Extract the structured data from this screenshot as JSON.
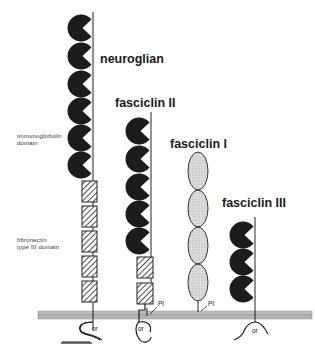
{
  "labels": {
    "neuroglian": "neuroglian",
    "fasciclin_ii": "fasciclin II",
    "fasciclin_i": "fasciclin I",
    "fasciclin_iii": "fasciclin III",
    "ig_domain_line1": "immunoglobulin",
    "ig_domain_line2": "domain",
    "fn_domain_line1": "fibronectin",
    "fn_domain_line2": "type III domain",
    "pi_1": "PI",
    "pi_2": "PI",
    "cyto_1": "or",
    "cyto_2": "or",
    "cyto_3": "or"
  },
  "colors": {
    "ig_domain": "#1c1c1c",
    "membrane": "#b5b5b5",
    "ellipse_fill": "#d6d6d6",
    "line": "#222222"
  },
  "proteins": [
    {
      "name": "neuroglian",
      "ig_domains": 6,
      "fn3_domains": 5,
      "anchor": "transmembrane"
    },
    {
      "name": "fasciclin II",
      "ig_domains": 5,
      "fn3_domains": 2,
      "anchor": "transmembrane / PI"
    },
    {
      "name": "fasciclin I",
      "fasciclin_domains": 4,
      "anchor": "PI"
    },
    {
      "name": "fasciclin III",
      "ig_domains": 3,
      "anchor": "transmembrane"
    }
  ]
}
